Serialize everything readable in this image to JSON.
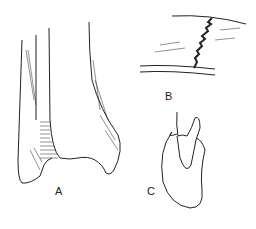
{
  "figure": {
    "panels": [
      {
        "label": "A",
        "subject": "bone-end"
      },
      {
        "label": "B",
        "subject": "skull-suture-joint"
      },
      {
        "label": "C",
        "subject": "tooth-in-socket"
      }
    ]
  }
}
